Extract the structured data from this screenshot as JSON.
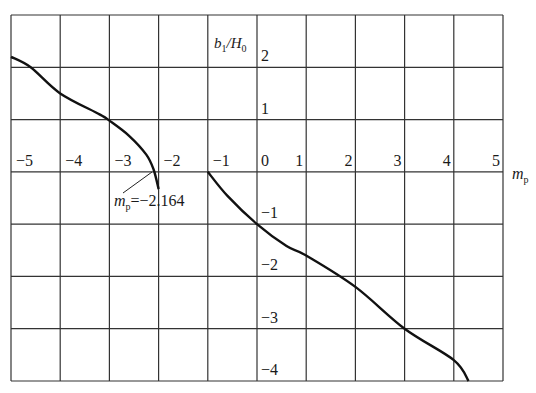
{
  "chart_data": {
    "type": "line",
    "title": "",
    "xlabel": "m_p",
    "ylabel": "b1/H0",
    "xlim": [
      -5,
      5
    ],
    "ylim": [
      -4,
      3
    ],
    "grid": true,
    "x_ticks": [
      "-5",
      "-4",
      "-3",
      "-2",
      "-1",
      "0",
      "1",
      "2",
      "3",
      "4",
      "5"
    ],
    "y_ticks": [
      "2",
      "1",
      "0",
      "-1",
      "-2",
      "-3",
      "-4"
    ],
    "series": [
      {
        "name": "left branch",
        "x": [
          -5.0,
          -4.6,
          -4.0,
          -3.2,
          -3.0,
          -2.6,
          -2.25,
          -2.1,
          -2.0
        ],
        "y": [
          2.2,
          2.0,
          1.5,
          1.1,
          0.98,
          0.69,
          0.33,
          0.04,
          -0.33
        ]
      },
      {
        "name": "right branch",
        "x": [
          -1.0,
          -0.6,
          0.0,
          0.6,
          1.0,
          2.0,
          3.0,
          4.0,
          4.3
        ],
        "y": [
          0.0,
          -0.46,
          -1.0,
          -1.42,
          -1.6,
          -2.2,
          -3.0,
          -3.6,
          -4.0
        ]
      }
    ],
    "annotations": [
      {
        "text": "m_p=-2.164",
        "x": -2.164,
        "y": 0
      }
    ]
  },
  "labels": {
    "ylabel_b": "b",
    "ylabel_sub1": "1",
    "ylabel_slash": "/H",
    "ylabel_sub0": "0",
    "xlabel_m": "m",
    "xlabel_sub": "p",
    "annotation_prefix": "m",
    "annotation_sub": "p",
    "annotation_value": "=−2.164",
    "xticks": [
      "−5",
      "−4",
      "−3",
      "−2",
      "−1",
      "0",
      "1",
      "2",
      "3",
      "4",
      "5"
    ],
    "yticks": [
      "2",
      "1",
      "−1",
      "−2",
      "−3",
      "−4"
    ]
  },
  "colors": {
    "grid": "#333333",
    "curve": "#111111",
    "background": "#ffffff"
  }
}
